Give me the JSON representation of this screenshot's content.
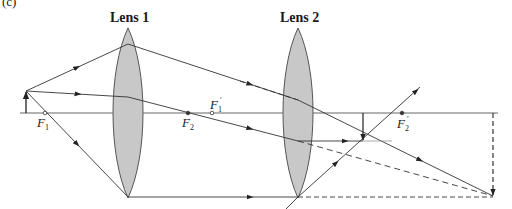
{
  "figure": {
    "panel_label": "(c)",
    "lens1": {
      "title": "Lens 1"
    },
    "lens2": {
      "title": "Lens 2"
    },
    "focal_points": {
      "F1": {
        "letter": "F",
        "sub": "1",
        "prime": ""
      },
      "F2": {
        "letter": "F",
        "sub": "2",
        "prime": ""
      },
      "F1_prime": {
        "letter": "F",
        "sub": "1",
        "prime": "′"
      },
      "F2_prime": {
        "letter": "F",
        "sub": "2",
        "prime": "′"
      }
    },
    "colors": {
      "line": "#333333",
      "lens_fill": "#c8c8c8",
      "lens_stroke": "#555555",
      "background": "#ffffff"
    }
  }
}
